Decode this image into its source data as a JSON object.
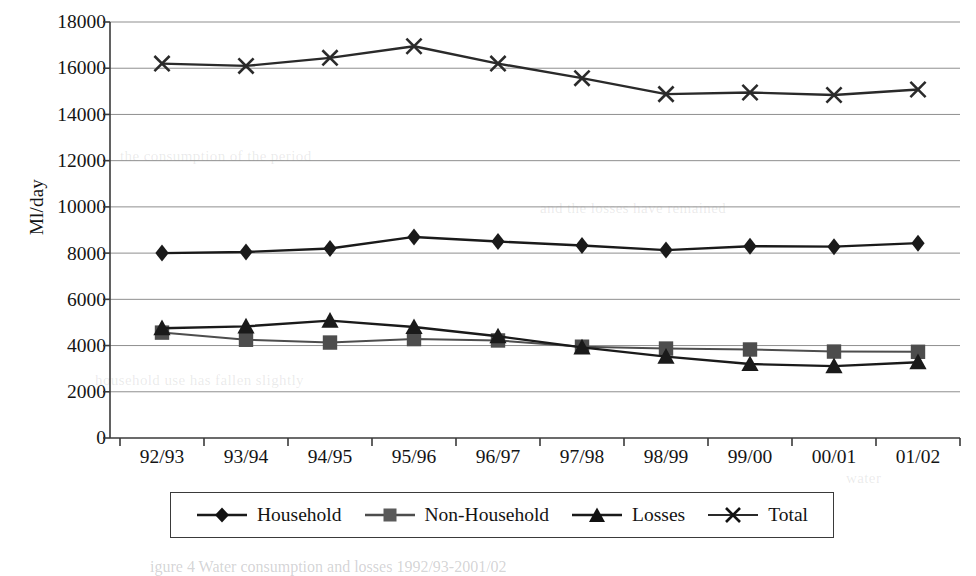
{
  "chart_data": {
    "type": "line",
    "title": "",
    "xlabel": "",
    "ylabel": "Ml/day",
    "ylim": [
      0,
      18000
    ],
    "ytick_step": 2000,
    "grid": true,
    "legend_position": "bottom",
    "categories": [
      "92/93",
      "93/94",
      "94/95",
      "95/96",
      "96/97",
      "97/98",
      "98/99",
      "99/00",
      "00/01",
      "01/02"
    ],
    "yticks": [
      "0",
      "2000",
      "4000",
      "6000",
      "8000",
      "10000",
      "12000",
      "14000",
      "16000",
      "18000"
    ],
    "series": [
      {
        "name": "Household",
        "marker": "diamond",
        "color": "#1a1a1a",
        "values": [
          8000,
          8050,
          8200,
          8700,
          8500,
          8330,
          8130,
          8300,
          8280,
          8430
        ]
      },
      {
        "name": "Non-Household",
        "marker": "square",
        "color": "#4d4d4d",
        "values": [
          4560,
          4250,
          4130,
          4280,
          4220,
          3950,
          3870,
          3830,
          3740,
          3730
        ]
      },
      {
        "name": "Losses",
        "marker": "triangle",
        "color": "#1a1a1a",
        "values": [
          4750,
          4830,
          5080,
          4800,
          4400,
          3920,
          3520,
          3200,
          3110,
          3280
        ]
      },
      {
        "name": "Total",
        "marker": "cross",
        "color": "#2a2a2a",
        "values": [
          16200,
          16100,
          16450,
          16950,
          16200,
          15570,
          14880,
          14950,
          14840,
          15080
        ]
      }
    ]
  },
  "legend": {
    "items": [
      {
        "label": "Household",
        "marker": "diamond"
      },
      {
        "label": "Non-Household",
        "marker": "square"
      },
      {
        "label": "Losses",
        "marker": "triangle"
      },
      {
        "label": "Total",
        "marker": "cross"
      }
    ]
  },
  "page_bleed": {
    "caption_fragment": "igure 4   Water consumption and losses  1992/93-2001/02"
  }
}
